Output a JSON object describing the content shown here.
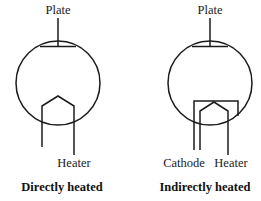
{
  "figure": {
    "background_color": "#ffffff",
    "line_color": "#1b1b1b",
    "text_color": "#1b1b1b",
    "width": 261,
    "height": 201
  },
  "diagrams": [
    {
      "id": "directly-heated",
      "caption": "Directly heated",
      "envelope": {
        "cx": 58,
        "cy": 83,
        "r": 42
      },
      "labels": {
        "plate": "Plate",
        "heater": "Heater"
      },
      "elements": [
        {
          "name": "plate-electrode",
          "type": "horizontal-bar"
        },
        {
          "name": "plate-lead",
          "type": "vertical-lead-up"
        },
        {
          "name": "heater-filament",
          "type": "inverted-v"
        },
        {
          "name": "heater-lead-left",
          "type": "vertical-lead-down"
        },
        {
          "name": "heater-lead-right",
          "type": "vertical-lead-down"
        }
      ]
    },
    {
      "id": "indirectly-heated",
      "caption": "Indirectly heated",
      "envelope": {
        "cx": 210,
        "cy": 83,
        "r": 42
      },
      "labels": {
        "plate": "Plate",
        "cathode": "Cathode",
        "heater": "Heater"
      },
      "elements": [
        {
          "name": "plate-electrode",
          "type": "horizontal-bar"
        },
        {
          "name": "plate-lead",
          "type": "vertical-lead-up"
        },
        {
          "name": "cathode-bracket",
          "type": "inverted-u"
        },
        {
          "name": "cathode-lead",
          "type": "vertical-lead-down"
        },
        {
          "name": "heater-filament",
          "type": "inverted-v"
        },
        {
          "name": "heater-lead-left",
          "type": "vertical-lead-down"
        },
        {
          "name": "heater-lead-right",
          "type": "vertical-lead-down"
        }
      ]
    }
  ]
}
